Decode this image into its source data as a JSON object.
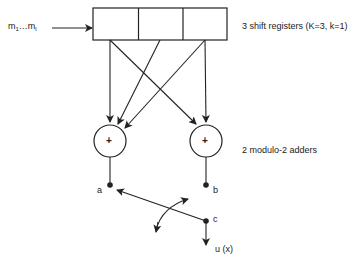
{
  "diagram": {
    "type": "convolutional-encoder",
    "input": {
      "label_main": "m",
      "sub1": "1",
      "dots": "…",
      "subl": "l"
    },
    "shift_register": {
      "cells": 3,
      "label": "3 shift registers (K=3, k=1)"
    },
    "adders": {
      "count": 2,
      "symbol": "+",
      "label": "2 modulo-2 adders",
      "connections": {
        "left_adder": [
          "cell1",
          "cell2",
          "cell3"
        ],
        "right_adder": [
          "cell1",
          "cell3"
        ]
      }
    },
    "nodes": {
      "a": "a",
      "b": "b",
      "c": "c"
    },
    "output": {
      "label": "u (x)"
    },
    "colors": {
      "stroke": "#222222",
      "background": "#ffffff"
    }
  }
}
